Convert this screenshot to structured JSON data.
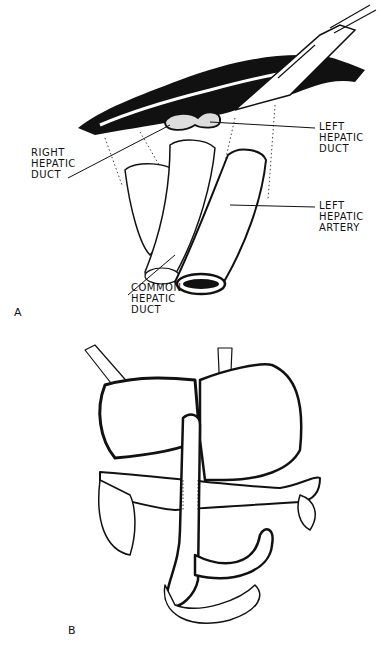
{
  "figure": {
    "panels": [
      {
        "id": "A",
        "letter": "A",
        "labels": {
          "right_hepatic_duct": [
            "RIGHT",
            "HEPATIC",
            "DUCT"
          ],
          "left_hepatic_duct": [
            "LEFT",
            "HEPATIC",
            "DUCT"
          ],
          "left_hepatic_artery": [
            "LEFT",
            "HEPATIC",
            "ARTERY"
          ],
          "common_hepatic_duct": [
            "COMMON",
            "HEPATIC",
            "DUCT"
          ]
        }
      },
      {
        "id": "B",
        "letter": "B",
        "labels": {}
      }
    ],
    "colors": {
      "ink": "#111111",
      "background": "#ffffff"
    }
  }
}
